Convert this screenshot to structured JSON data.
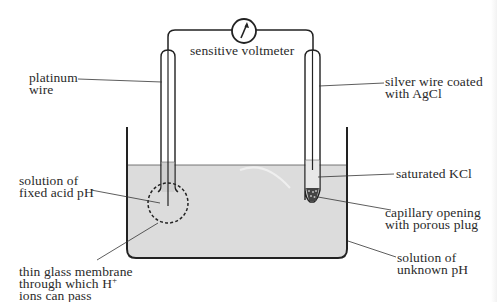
{
  "diagram": {
    "colors": {
      "line": "#222222",
      "liquid": "#dcdcdc",
      "background": "#ffffff",
      "text": "#2a2a2a"
    },
    "components": {
      "voltmeter": {
        "label": "sensitive voltmeter",
        "icon": "voltmeter-needle-icon"
      },
      "glass_electrode": {
        "wire": "platinum wire",
        "fill": "solution of fixed acid pH",
        "membrane": "thin glass membrane through which H+ ions can pass"
      },
      "reference_electrode": {
        "wire": "silver wire coated with AgCl",
        "fill": "saturated KCl",
        "tip": "capillary opening with porous plug"
      },
      "beaker": {
        "contents": "solution of unknown pH"
      }
    }
  },
  "labels": {
    "voltmeter": "sensitive voltmeter",
    "platinum": [
      "platinum",
      "wire"
    ],
    "silver": [
      "silver wire coated",
      "with AgCl"
    ],
    "fixed_acid": [
      "solution of",
      "fixed acid pH"
    ],
    "kcl": "saturated KCl",
    "capillary": [
      "capillary opening",
      "with porous plug"
    ],
    "unknown": [
      "solution of",
      "unknown pH"
    ],
    "membrane": [
      "thin glass membrane",
      "through which H",
      "ions can pass"
    ],
    "membrane_sup": "+"
  }
}
